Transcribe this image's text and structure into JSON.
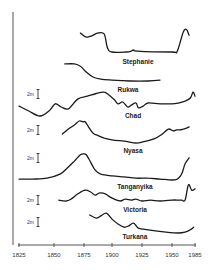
{
  "chart_data": {
    "type": "line",
    "title": "",
    "xlabel": "",
    "ylabel": "",
    "x_ticks": [
      1825,
      1850,
      1875,
      1900,
      1925,
      1950,
      1985
    ],
    "xlim": [
      1825,
      1985
    ],
    "grid": false,
    "legend": "none",
    "scale_bar_label": "2m",
    "scale_bar_meters": 2,
    "series": [
      {
        "name": "Stephanie",
        "label": "Stephanie",
        "x": [
          1872,
          1877,
          1882,
          1887,
          1893,
          1896,
          1900,
          1912,
          1916,
          1918,
          1921,
          1950,
          1958,
          1967,
          1972,
          1976
        ],
        "y": [
          4.2,
          3.3,
          3.6,
          4.2,
          4.0,
          0.9,
          0.0,
          0.0,
          0.2,
          0.5,
          0.2,
          0.0,
          0.2,
          4.4,
          5.0,
          3.7
        ],
        "scale_bar": false
      },
      {
        "name": "Rukwa",
        "label": "Rukwa",
        "x": [
          1859,
          1867,
          1872,
          1877,
          1883,
          1890,
          1900,
          1915,
          1930,
          1940
        ],
        "y": [
          3.8,
          3.8,
          3.3,
          2.0,
          0.9,
          0.4,
          0.2,
          0.0,
          0.0,
          0.2
        ],
        "scale_bar": false
      },
      {
        "name": "Chad",
        "label": "Chad",
        "x": [
          1825,
          1832,
          1840,
          1847,
          1851,
          1856,
          1862,
          1870,
          1878,
          1886,
          1893,
          1897,
          1902,
          1905,
          1909,
          1913,
          1916,
          1920,
          1922,
          1926,
          1930,
          1940,
          1950,
          1960,
          1970,
          1978,
          1982,
          1985
        ],
        "y": [
          2.2,
          1.1,
          0.0,
          1.3,
          2.7,
          2.0,
          1.6,
          3.8,
          4.4,
          5.0,
          5.3,
          4.7,
          3.6,
          2.7,
          3.1,
          2.0,
          2.4,
          2.9,
          1.8,
          2.2,
          2.9,
          2.7,
          2.7,
          2.9,
          3.3,
          4.0,
          5.3,
          4.4
        ],
        "scale_bar": true
      },
      {
        "name": "Nyasa",
        "label": "Nyasa",
        "x": [
          1857,
          1862,
          1867,
          1871,
          1874,
          1876,
          1879,
          1883,
          1888,
          1893,
          1900,
          1910,
          1920,
          1925,
          1935,
          1942,
          1947,
          1952,
          1957,
          1962,
          1967,
          1972,
          1976
        ],
        "y": [
          2.0,
          3.1,
          4.0,
          4.9,
          4.7,
          4.7,
          3.6,
          2.2,
          1.6,
          1.1,
          0.7,
          0.4,
          0.0,
          0.2,
          0.9,
          2.0,
          3.1,
          2.7,
          2.9,
          2.9,
          3.1,
          3.3,
          3.6
        ],
        "scale_bar": true
      },
      {
        "name": "Tanganyika",
        "label": "Tanganyika",
        "x": [
          1825,
          1835,
          1845,
          1855,
          1862,
          1867,
          1872,
          1875,
          1877,
          1880,
          1885,
          1890,
          1900,
          1910,
          1920,
          1930,
          1940,
          1950,
          1958,
          1963,
          1966,
          1970,
          1976
        ],
        "y": [
          0.2,
          0.2,
          0.4,
          1.3,
          2.9,
          4.2,
          5.6,
          5.8,
          5.6,
          4.4,
          2.2,
          1.3,
          0.9,
          0.7,
          0.4,
          0.4,
          0.2,
          0.0,
          0.2,
          0.9,
          1.8,
          3.6,
          4.9
        ],
        "scale_bar": true
      },
      {
        "name": "Victoria",
        "label": "Victoria",
        "x": [
          1854,
          1860,
          1864,
          1870,
          1876,
          1881,
          1885,
          1889,
          1894,
          1898,
          1902,
          1907,
          1911,
          1916,
          1920,
          1925,
          1932,
          1940,
          1950,
          1960,
          1965,
          1970,
          1975,
          1980,
          1985
        ],
        "y": [
          0.2,
          0.0,
          0.4,
          1.6,
          2.4,
          2.0,
          1.3,
          1.8,
          1.6,
          0.9,
          0.4,
          0.0,
          0.4,
          0.2,
          0.4,
          0.0,
          0.2,
          0.0,
          0.2,
          0.2,
          0.2,
          0.2,
          3.6,
          2.4,
          2.7
        ],
        "scale_bar": true
      },
      {
        "name": "Turkana",
        "label": "Turkana",
        "x": [
          1880,
          1886,
          1890,
          1895,
          1900,
          1905,
          1910,
          1914,
          1918,
          1922,
          1930,
          1945,
          1960,
          1970,
          1978,
          1983
        ],
        "y": [
          4.0,
          3.3,
          3.8,
          4.4,
          3.1,
          2.0,
          1.3,
          1.6,
          2.2,
          1.1,
          0.7,
          0.2,
          0.0,
          0.2,
          0.7,
          1.3
        ],
        "scale_bar": true
      }
    ]
  }
}
